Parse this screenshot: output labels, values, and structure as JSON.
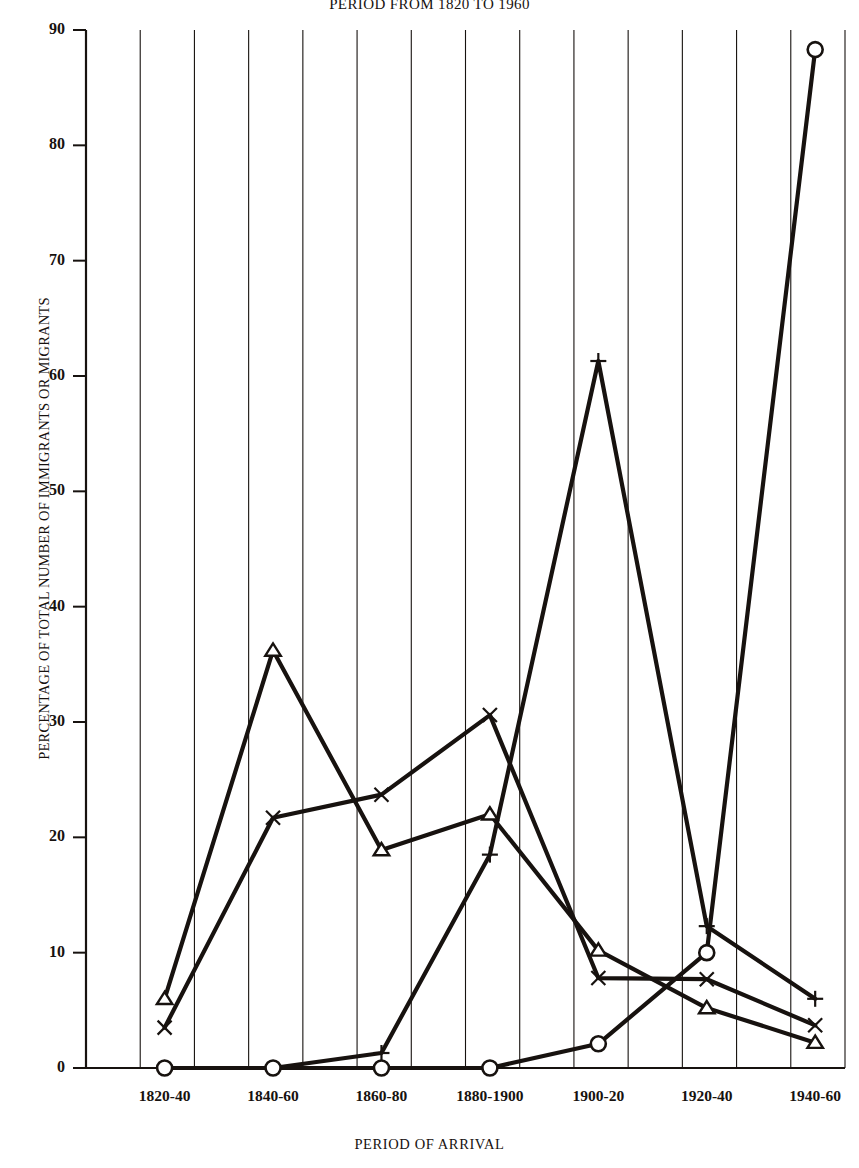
{
  "chart_data": {
    "type": "line",
    "title": "PERIOD FROM 1820 TO 1960",
    "xlabel": "PERIOD OF ARRIVAL",
    "ylabel": "PERCENTAGE OF TOTAL NUMBER OF IMMIGRANTS OR MIGRANTS",
    "categories": [
      "1820-40",
      "1840-60",
      "1860-80",
      "1880-1900",
      "1900-20",
      "1920-40",
      "1940-60"
    ],
    "ylim": [
      0,
      90
    ],
    "yticks": [
      0,
      10,
      20,
      30,
      40,
      50,
      60,
      70,
      80,
      90
    ],
    "grid": "vertical",
    "legend": "none",
    "series": [
      {
        "name": "triangle-series",
        "marker": "triangle",
        "values": [
          6.0,
          36.2,
          18.9,
          22.0,
          10.2,
          5.2,
          2.2
        ]
      },
      {
        "name": "cross-series",
        "marker": "x",
        "values": [
          3.5,
          21.7,
          23.7,
          30.6,
          7.8,
          7.7,
          3.7
        ]
      },
      {
        "name": "plus-series",
        "marker": "plus",
        "values": [
          0.0,
          0.0,
          1.3,
          18.5,
          61.3,
          12.3,
          6.0
        ]
      },
      {
        "name": "circle-series",
        "marker": "circle",
        "values": [
          0.0,
          0.0,
          0.0,
          0.0,
          2.1,
          10.0,
          88.3
        ]
      }
    ]
  },
  "colors": {
    "ink": "#17120f",
    "grid": "#17120f",
    "background": "#ffffff"
  }
}
